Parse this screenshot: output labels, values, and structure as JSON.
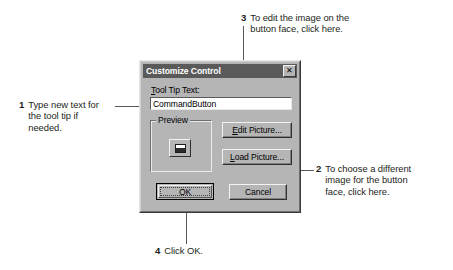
{
  "dialog": {
    "title": "Customize Control",
    "close_button_glyph": "✕",
    "tooltip_label_accel": "T",
    "tooltip_label_rest": "ool Tip Text:",
    "tooltip_value": "CommandButton",
    "preview_group_label": "Preview",
    "edit_picture": {
      "accel": "E",
      "rest": "dit Picture..."
    },
    "load_picture": {
      "accel": "L",
      "rest": "oad Picture..."
    },
    "ok_label": "OK",
    "cancel_label": "Cancel"
  },
  "callouts": [
    {
      "number": "1",
      "text": "Type new text for\nthe tool tip if\nneeded."
    },
    {
      "number": "2",
      "text": "To choose a different\nimage for the button\nface, click here."
    },
    {
      "number": "3",
      "text": "To edit the image on the\nbutton face, click here."
    },
    {
      "number": "4",
      "text": "Click OK."
    }
  ],
  "colors": {
    "page_background": "#ffffff",
    "dialog_face": "#b5b5b5",
    "titlebar": "#5a5a5a",
    "titlebar_text": "#ffffff",
    "text": "#231f20",
    "leader_line": "#58595b",
    "field_background": "#ffffff"
  }
}
